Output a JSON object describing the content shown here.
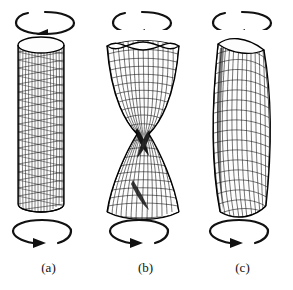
{
  "figure": {
    "background_color": "#ffffff",
    "ink_color": "#111111",
    "width": 293,
    "height": 290,
    "panels": [
      {
        "id": "a",
        "caption": "(a)",
        "shape": "straight-cylinder",
        "description": "Undeformed circular cylindrical shell with diagonal twisted mesh",
        "top_arrow": {
          "name": "rotation-arrow-top",
          "direction": "arrowhead-left",
          "gap_side": "left"
        },
        "bottom_arrow": {
          "name": "rotation-arrow-bottom",
          "direction": "arrowhead-right",
          "gap_side": "right"
        }
      },
      {
        "id": "b",
        "caption": "(b)",
        "shape": "hourglass-waisted",
        "description": "Torsional buckling mode with pinched waist and wavy rim",
        "top_arrow": {
          "name": "rotation-arrow-top",
          "direction": "arrowhead-left",
          "gap_side": "left"
        },
        "bottom_arrow": {
          "name": "rotation-arrow-bottom",
          "direction": "arrowhead-right",
          "gap_side": "right"
        }
      },
      {
        "id": "c",
        "caption": "(c)",
        "shape": "bent-lobed-column",
        "description": "Buckled column bowing sideways with single lobe",
        "top_arrow": {
          "name": "rotation-arrow-top",
          "direction": "arrowhead-left",
          "gap_side": "left"
        },
        "bottom_arrow": {
          "name": "rotation-arrow-bottom",
          "direction": "arrowhead-right",
          "gap_side": "right"
        }
      }
    ]
  }
}
